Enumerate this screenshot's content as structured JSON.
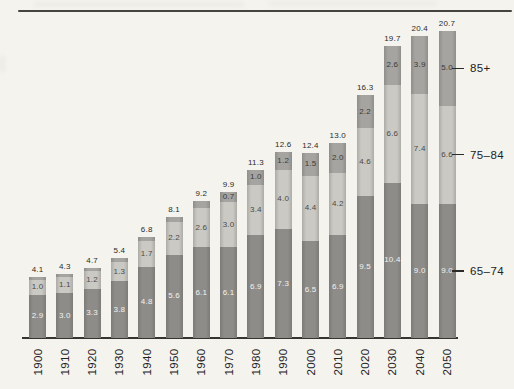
{
  "chart_data": {
    "type": "bar",
    "stacked": true,
    "title": "",
    "categories": [
      "1900",
      "1910",
      "1920",
      "1930",
      "1940",
      "1950",
      "1960",
      "1970",
      "1980",
      "1990",
      "2000",
      "2010",
      "2020",
      "2030",
      "2040",
      "2050"
    ],
    "series": [
      {
        "name": "65-74",
        "color": "#8d8c89",
        "label_color": "#f3f2ee",
        "values": [
          2.9,
          3.0,
          3.3,
          3.8,
          4.8,
          5.6,
          6.1,
          6.1,
          6.9,
          7.3,
          6.5,
          6.9,
          9.5,
          10.4,
          9.0,
          9.0
        ],
        "labels": [
          "2.9",
          "3.0",
          "3.3",
          "3.8",
          "4.8",
          "5.6",
          "6.1",
          "6.1",
          "6.9",
          "7.3",
          "6.5",
          "6.9",
          "9.5",
          "10.4",
          "9.0",
          "9.0"
        ]
      },
      {
        "name": "75-84",
        "color": "#cac9c4",
        "label_color": "#4a4944",
        "values": [
          1.0,
          1.1,
          1.2,
          1.3,
          1.7,
          2.2,
          2.6,
          3.0,
          3.4,
          4.0,
          4.4,
          4.2,
          4.6,
          6.6,
          7.4,
          6.6
        ],
        "labels": [
          "1.0",
          "1.1",
          "1.2",
          "1.3",
          "1.7",
          "2.2",
          "2.6",
          "3.0",
          "3.4",
          "4.0",
          "4.4",
          "4.2",
          "4.6",
          "6.6",
          "7.4",
          "6.6"
        ]
      },
      {
        "name": "85+",
        "color": "#a5a4a0",
        "label_color": "#3b3a36",
        "values": [
          0.2,
          0.2,
          0.2,
          0.3,
          0.3,
          0.3,
          0.5,
          0.7,
          1.0,
          1.2,
          1.5,
          2.0,
          2.2,
          2.6,
          3.9,
          5.0
        ],
        "labels": [
          null,
          null,
          null,
          null,
          null,
          null,
          null,
          "0.7",
          "1.0",
          "1.2",
          "1.5",
          "2.0",
          "2.2",
          "2.6",
          "3.9",
          "5.0"
        ]
      }
    ],
    "totals": [
      "4.1",
      "4.3",
      "4.7",
      "5.4",
      "6.8",
      "8.1",
      "9.2",
      "9.9",
      "11.3",
      "12.6",
      "12.4",
      "13.0",
      "16.3",
      "19.7",
      "20.4",
      "20.7"
    ],
    "right_axis_labels": [
      "85+",
      "75–84",
      "65–74"
    ],
    "ylim": [
      0,
      21
    ],
    "grid": false,
    "legend_position": "right"
  },
  "colors": {
    "background": "#f4f3ee",
    "axis": "#35342f",
    "top_rule": "#45443f",
    "text": "#23221e"
  }
}
